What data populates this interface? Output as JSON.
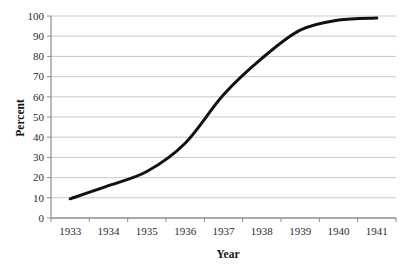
{
  "chart_data": {
    "type": "line",
    "title": "",
    "subtitle": "",
    "xlabel": "Year",
    "ylabel": "Percent",
    "categories": [
      "1933",
      "1934",
      "1935",
      "1936",
      "1937",
      "1938",
      "1939",
      "1940",
      "1941"
    ],
    "x": [
      1933,
      1934,
      1935,
      1936,
      1937,
      1938,
      1939,
      1940,
      1941
    ],
    "values": [
      9.5,
      16,
      23,
      37,
      61,
      79,
      93,
      98,
      99
    ],
    "series": [
      {
        "name": "Percent",
        "values": [
          9.5,
          16,
          23,
          37,
          61,
          79,
          93,
          98,
          99
        ]
      }
    ],
    "ylim": [
      0,
      100
    ],
    "ytick_values": [
      0,
      10,
      20,
      30,
      40,
      50,
      60,
      70,
      80,
      90,
      100
    ],
    "ytick_labels": [
      "0",
      "10",
      "20",
      "30",
      "40",
      "50",
      "60",
      "70",
      "80",
      "90",
      "100"
    ],
    "xtick_labels": [
      "1933",
      "1934",
      "1935",
      "1936",
      "1937",
      "1938",
      "1939",
      "1940",
      "1941"
    ],
    "grid": true,
    "grid_axis": "y",
    "legend": false,
    "legend_position": "none",
    "smoothed": true,
    "annotations": [],
    "colors": {
      "line": "#111111",
      "gridline": "#c9c9c9",
      "axis": "#8c8c8c",
      "tick_text": "#2b2b2b",
      "axis_title": "#141414",
      "background": "#ffffff"
    },
    "line_width": 3
  }
}
